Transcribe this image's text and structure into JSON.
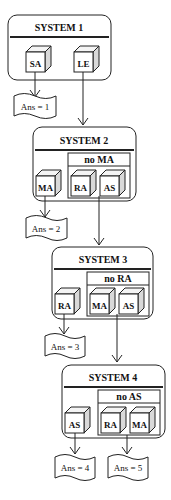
{
  "systems": [
    {
      "title": "SYSTEM 1",
      "group_label": null,
      "outside": [
        "SA"
      ],
      "inside": [
        "LE"
      ],
      "answer": "Ans = 1"
    },
    {
      "title": "SYSTEM 2",
      "group_label": "no MA",
      "outside": [
        "MA"
      ],
      "inside": [
        "RA",
        "AS"
      ],
      "answer": "Ans = 2"
    },
    {
      "title": "SYSTEM 3",
      "group_label": "no RA",
      "outside": [
        "RA"
      ],
      "inside": [
        "MA",
        "AS"
      ],
      "answer": "Ans = 3"
    },
    {
      "title": "SYSTEM 4",
      "group_label": "no AS",
      "outside": [
        "AS"
      ],
      "inside": [
        "RA",
        "MA"
      ],
      "answer": "Ans = 4",
      "answer2": "Ans = 5"
    }
  ],
  "colors": {
    "line": "#222222",
    "cube_side": "#d9d9d9",
    "background": "#ffffff"
  }
}
